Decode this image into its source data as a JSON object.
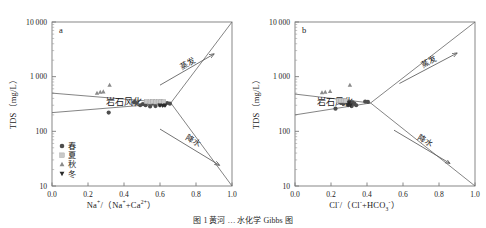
{
  "figure": {
    "caption": "图 1  黄河 … 水化学 Gibbs 图",
    "panels": [
      {
        "tag": "a",
        "xlabel_html": "Na<sup>+</sup>/（Na<sup>+</sup>+Ca<sup>2+</sup>）",
        "ylabel_html": "TDS（mg/L）"
      },
      {
        "tag": "b",
        "xlabel_html": "Cl<sup>-</sup>/（Cl<sup>-</sup>+HCO<sub>3</sub><sup>-</sup>）",
        "ylabel_html": "TDS（mg/L）"
      }
    ]
  },
  "legend": {
    "position": "lower-left-panel-a",
    "items": [
      {
        "label": "春",
        "marker": "circle",
        "color": "#4d4d4d"
      },
      {
        "label": "夏",
        "marker": "square",
        "color": "#c9c9c9"
      },
      {
        "label": "秋",
        "marker": "triangle-up",
        "color": "#8a8a8a"
      },
      {
        "label": "冬",
        "marker": "triangle-down",
        "color": "#2b2b2b"
      }
    ]
  },
  "annotations": {
    "rock_weathering": "岩石风化",
    "evaporation": "蒸发",
    "precipitation": "降水"
  },
  "chart_data": {
    "type": "scatter",
    "title": "",
    "layout": "two-panel Gibbs diagram",
    "xlim": [
      0.0,
      1.0
    ],
    "ylim": [
      10,
      10000
    ],
    "yscale": "log",
    "grid": false,
    "xticks": [
      0.0,
      0.2,
      0.4,
      0.6,
      0.8,
      1.0
    ],
    "xticklabels": [
      "0.0",
      "0.2",
      "0.4",
      "0.6",
      "0.8",
      "1.0"
    ],
    "yticks": [
      10,
      100,
      1000,
      10000
    ],
    "yticklabels": [
      "10",
      "100",
      "1 000",
      "10 000"
    ],
    "legend_position": "lower left (panel a)",
    "panels": [
      {
        "tag": "a",
        "xlabel": "Na+/(Na+ + Ca2+)",
        "ylabel": "TDS (mg/L)",
        "envelope": {
          "upper": [
            [
              0.0,
              500
            ],
            [
              0.66,
              330
            ],
            [
              1.0,
              10000
            ]
          ],
          "lower": [
            [
              0.0,
              220
            ],
            [
              0.66,
              330
            ],
            [
              1.0,
              10
            ]
          ]
        },
        "arrows": [
          {
            "label": "蒸发",
            "from": [
              0.6,
              700
            ],
            "to": [
              0.9,
              2600
            ]
          },
          {
            "label": "降水",
            "from": [
              0.6,
              110
            ],
            "to": [
              0.93,
              24
            ]
          }
        ],
        "series": [
          {
            "name": "春",
            "marker": "circle",
            "color": "#4d4d4d",
            "points": [
              [
                0.315,
                220
              ],
              [
                0.455,
                340
              ],
              [
                0.47,
                330
              ],
              [
                0.49,
                300
              ],
              [
                0.505,
                315
              ],
              [
                0.52,
                300
              ],
              [
                0.54,
                330
              ],
              [
                0.545,
                285
              ],
              [
                0.56,
                320
              ],
              [
                0.575,
                290
              ],
              [
                0.585,
                340
              ],
              [
                0.6,
                300
              ],
              [
                0.612,
                320
              ],
              [
                0.625,
                300
              ],
              [
                0.64,
                330
              ],
              [
                0.655,
                320
              ]
            ]
          },
          {
            "name": "夏",
            "marker": "square",
            "color": "#c9c9c9",
            "points": [
              [
                0.525,
                350
              ],
              [
                0.545,
                345
              ],
              [
                0.56,
                350
              ],
              [
                0.575,
                345
              ],
              [
                0.59,
                350
              ],
              [
                0.605,
                345
              ],
              [
                0.62,
                348
              ]
            ]
          },
          {
            "name": "秋",
            "marker": "triangle-up",
            "color": "#8a8a8a",
            "points": [
              [
                0.25,
                500
              ],
              [
                0.268,
                520
              ],
              [
                0.285,
                530
              ],
              [
                0.32,
                700
              ]
            ]
          },
          {
            "name": "冬",
            "marker": "triangle-down",
            "color": "#2b2b2b",
            "points": [
              [
                0.6,
                300
              ],
              [
                0.615,
                295
              ],
              [
                0.628,
                300
              ]
            ]
          }
        ]
      },
      {
        "tag": "b",
        "xlabel": "Cl-/(Cl- + HCO3-)",
        "ylabel": "TDS (mg/L)",
        "envelope": {
          "upper": [
            [
              0.0,
              480
            ],
            [
              0.42,
              330
            ],
            [
              1.0,
              10000
            ]
          ],
          "lower": [
            [
              0.0,
              200
            ],
            [
              0.42,
              330
            ],
            [
              1.0,
              10
            ]
          ]
        },
        "arrows": [
          {
            "label": "蒸发",
            "from": [
              0.58,
              750
            ],
            "to": [
              0.9,
              2700
            ]
          },
          {
            "label": "降水",
            "from": [
              0.55,
              105
            ],
            "to": [
              0.86,
              26
            ]
          }
        ],
        "series": [
          {
            "name": "春",
            "marker": "circle",
            "color": "#4d4d4d",
            "points": [
              [
                0.225,
                260
              ],
              [
                0.255,
                330
              ],
              [
                0.27,
                320
              ],
              [
                0.285,
                340
              ],
              [
                0.295,
                300
              ],
              [
                0.3,
                350
              ],
              [
                0.305,
                315
              ],
              [
                0.31,
                330
              ],
              [
                0.315,
                290
              ],
              [
                0.32,
                340
              ],
              [
                0.33,
                320
              ],
              [
                0.34,
                300
              ],
              [
                0.39,
                350
              ],
              [
                0.405,
                345
              ]
            ]
          },
          {
            "name": "夏",
            "marker": "square",
            "color": "#c9c9c9",
            "points": [
              [
                0.24,
                365
              ],
              [
                0.255,
                362
              ],
              [
                0.268,
                365
              ],
              [
                0.28,
                360
              ]
            ]
          },
          {
            "name": "秋",
            "marker": "triangle-up",
            "color": "#8a8a8a",
            "points": [
              [
                0.15,
                510
              ],
              [
                0.168,
                520
              ],
              [
                0.195,
                540
              ],
              [
                0.305,
                700
              ]
            ]
          },
          {
            "name": "冬",
            "marker": "triangle-down",
            "color": "#2b2b2b",
            "points": [
              [
                0.295,
                305
              ],
              [
                0.3,
                330
              ],
              [
                0.308,
                300
              ]
            ]
          }
        ]
      }
    ]
  }
}
